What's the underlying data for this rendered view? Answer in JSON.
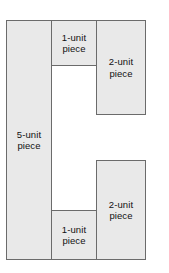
{
  "figure": {
    "background_color": "#ffffff",
    "fill_color": "#e9e9e9",
    "stroke_color": "#6b6b6b",
    "text_color": "#111111",
    "pieces": [
      {
        "id": "left",
        "label": "5-unit\npiece",
        "units": 5,
        "position": "left-column-full-height"
      },
      {
        "id": "mid-top",
        "label": "1-unit\npiece",
        "units": 1,
        "position": "middle-column-top"
      },
      {
        "id": "right-top",
        "label": "2-unit\npiece",
        "units": 2,
        "position": "right-column-top"
      },
      {
        "id": "right-bottom",
        "label": "2-unit\npiece",
        "units": 2,
        "position": "right-column-bottom"
      },
      {
        "id": "mid-bottom",
        "label": "1-unit\npiece",
        "units": 1,
        "position": "middle-column-bottom"
      }
    ]
  }
}
